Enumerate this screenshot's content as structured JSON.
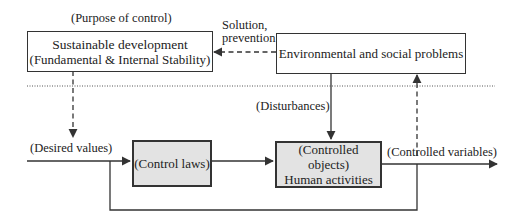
{
  "diagram": {
    "labels": {
      "purpose": "(Purpose of control)",
      "solution_line1": "Solution,",
      "solution_line2": "prevention",
      "disturbances": "(Disturbances)",
      "desired_values": "(Desired values)",
      "controlled_variables": "(Controlled variables)"
    },
    "boxes": {
      "sustainable": {
        "line1": "Sustainable development",
        "line2": "(Fundamental & Internal Stability)"
      },
      "environmental": {
        "line1": "Environmental and social problems"
      },
      "control_laws": {
        "line1": "(Control laws)"
      },
      "controlled_objects": {
        "line1": "(Controlled objects)",
        "line2": "Human activities"
      }
    },
    "colors": {
      "line": "#333333",
      "shaded_box": "#e3e3e3",
      "background": "#ffffff"
    }
  }
}
